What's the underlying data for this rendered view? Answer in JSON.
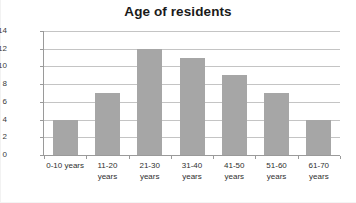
{
  "chart_data": {
    "type": "bar",
    "title": "Age of residents",
    "xlabel": "",
    "ylabel": "",
    "categories": [
      "0-10 years",
      "11-20 years",
      "21-30 years",
      "31-40 years",
      "41-50 years",
      "51-60 years",
      "61-70 years"
    ],
    "category_lines": [
      [
        "0-10 years",
        ""
      ],
      [
        "11-20",
        "years"
      ],
      [
        "21-30",
        "years"
      ],
      [
        "31-40",
        "years"
      ],
      [
        "41-50",
        "years"
      ],
      [
        "51-60",
        "years"
      ],
      [
        "61-70",
        "years"
      ]
    ],
    "values": [
      4,
      7,
      12,
      11,
      9,
      7,
      4
    ],
    "ylim": [
      0,
      14
    ],
    "yticks": [
      0,
      2,
      4,
      6,
      8,
      10,
      12,
      14
    ],
    "ytick_labels": [
      "0",
      "2",
      "4",
      "6",
      "8",
      "10",
      "12",
      "14"
    ],
    "grid": true,
    "legend": false,
    "bar_color": "#a6a6a6",
    "gridline_color": "#c4c4c4",
    "axis_color": "#9a9a9a",
    "title_color": "#1a1a1a",
    "background_color": "#ffffff"
  }
}
